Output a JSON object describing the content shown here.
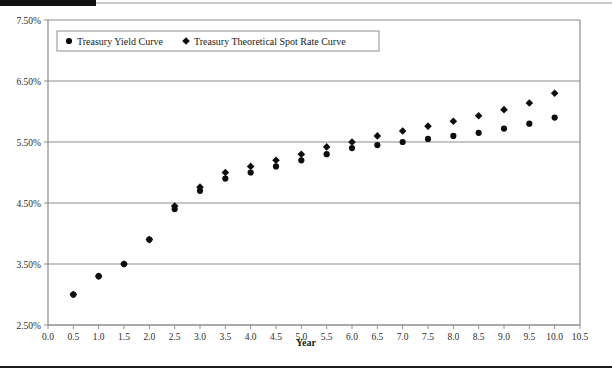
{
  "chart_data": {
    "type": "scatter",
    "title": "",
    "xlabel": "Year",
    "ylabel": "",
    "xlim": [
      0.0,
      10.5
    ],
    "ylim": [
      2.5,
      7.5
    ],
    "grid": true,
    "legend_position": "top-left-inside",
    "x_ticks": [
      "0.0",
      "0.5",
      "1.0",
      "1.5",
      "2.0",
      "2.5",
      "3.0",
      "3.5",
      "4.0",
      "4.5",
      "5.0",
      "5.5",
      "6.0",
      "6.5",
      "7.0",
      "7.5",
      "8.0",
      "8.5",
      "9.0",
      "9.5",
      "10.0",
      "10.5"
    ],
    "x_tick_values": [
      0.0,
      0.5,
      1.0,
      1.5,
      2.0,
      2.5,
      3.0,
      3.5,
      4.0,
      4.5,
      5.0,
      5.5,
      6.0,
      6.5,
      7.0,
      7.5,
      8.0,
      8.5,
      9.0,
      9.5,
      10.0,
      10.5
    ],
    "y_ticks": [
      "2.50%",
      "3.50%",
      "4.50%",
      "5.50%",
      "6.50%",
      "7.50%"
    ],
    "y_tick_values": [
      2.5,
      3.5,
      4.5,
      5.5,
      6.5,
      7.5
    ],
    "x": [
      0.5,
      1.0,
      1.5,
      2.0,
      2.5,
      3.0,
      3.5,
      4.0,
      4.5,
      5.0,
      5.5,
      6.0,
      6.5,
      7.0,
      7.5,
      8.0,
      8.5,
      9.0,
      9.5,
      10.0
    ],
    "series": [
      {
        "name": "Treasury Yield Curve",
        "marker": "circle",
        "color": "#0d0d0d",
        "values": [
          3.0,
          3.3,
          3.5,
          3.9,
          4.4,
          4.7,
          4.9,
          5.0,
          5.1,
          5.2,
          5.3,
          5.4,
          5.45,
          5.5,
          5.55,
          5.6,
          5.65,
          5.72,
          5.8,
          5.9
        ]
      },
      {
        "name": "Treasury Theoretical Spot Rate Curve",
        "marker": "diamond",
        "color": "#0d0d0d",
        "values": [
          3.0,
          3.3,
          3.5,
          3.9,
          4.45,
          4.76,
          5.0,
          5.1,
          5.2,
          5.3,
          5.42,
          5.5,
          5.6,
          5.68,
          5.76,
          5.84,
          5.93,
          6.03,
          6.14,
          6.3
        ]
      }
    ]
  },
  "legend": {
    "entries": [
      {
        "label": "Treasury Yield Curve",
        "marker": "circle"
      },
      {
        "label": "Treasury Theoretical Spot Rate Curve",
        "marker": "diamond"
      }
    ]
  },
  "axes": {
    "x_title": "Year"
  }
}
